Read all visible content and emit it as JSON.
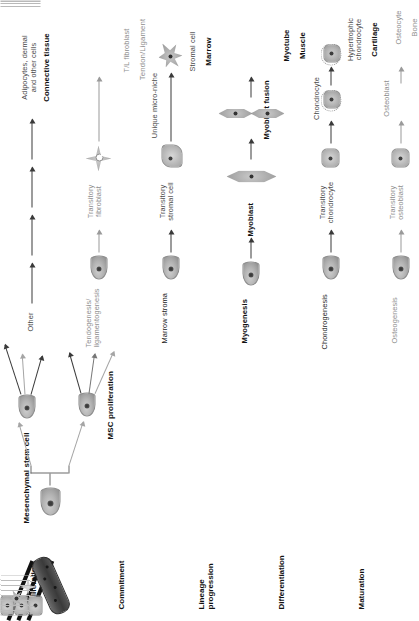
{
  "figure": {
    "root_cell_label": "Mesenchymal stem cell",
    "proliferation_label": "MSC proliferation"
  },
  "stages": [
    {
      "id": "proliferation",
      "label": "Proliferation"
    },
    {
      "id": "commitment",
      "label": "Commitment"
    },
    {
      "id": "lineage-progression",
      "label": "Lineage\nprogression"
    },
    {
      "id": "differentiation",
      "label": "Differentiation"
    },
    {
      "id": "maturation",
      "label": "Maturation"
    }
  ],
  "lineages": [
    {
      "id": "osteogenesis",
      "commitment": "Osteogenesis",
      "lineage_progression": "Transitory\nosteoblast",
      "differentiation": "Osteoblast",
      "maturation": "Osteocyte",
      "tissue": "Bone",
      "tone": "gray"
    },
    {
      "id": "chondrogenesis",
      "commitment": "Chondrogenesis",
      "lineage_progression": "Transitory\nchondrocyte",
      "differentiation": "Chondrocyte",
      "maturation": "Hypertrophic\nchondrocyte",
      "tissue": "Cartilage",
      "tone": "dark"
    },
    {
      "id": "myogenesis",
      "commitment": "Myogenesis",
      "lineage_progression": "Myoblast",
      "differentiation": "Myoblast fusion",
      "maturation": "Myotube",
      "tissue": "Muscle",
      "tone": "dark"
    },
    {
      "id": "marrow-stroma",
      "commitment": "Marrow stroma",
      "lineage_progression": "Transitory\nstromal cell",
      "differentiation": "Unique micro-niche",
      "maturation": "Stromal cell",
      "tissue": "Marrow",
      "tone": "dark"
    },
    {
      "id": "tendogenesis",
      "commitment": "Tendogenesis/\nligamentogenesis",
      "lineage_progression": "Transitory\nfibroblast",
      "differentiation": "",
      "maturation": "T/L fibroblast",
      "tissue": "Tendon/Ligament",
      "tone": "gray"
    },
    {
      "id": "other",
      "commitment": "Other",
      "lineage_progression": "",
      "differentiation": "",
      "maturation": "Adipocytes, dermal\nand other cells",
      "tissue": "Connective tissue",
      "tone": "dark"
    }
  ],
  "colors": {
    "text_dark": "#1c1c1c",
    "text_gray": "#8e8e8e",
    "arrow_dark": "#3a3a3a",
    "arrow_light": "#9a9a9a",
    "cell_fill": "#b4b4b4",
    "tendon_band": "#111111"
  }
}
